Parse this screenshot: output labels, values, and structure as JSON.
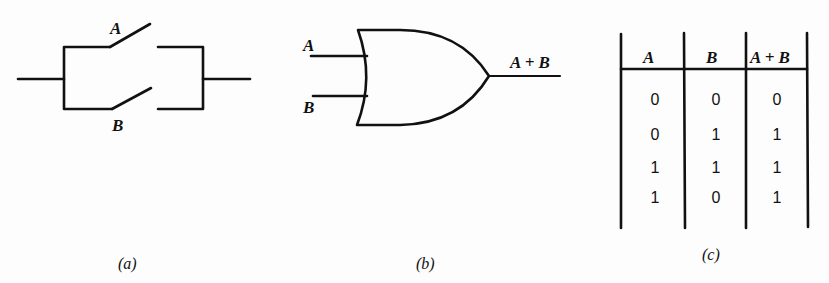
{
  "figure": {
    "panels": [
      {
        "id": "a",
        "caption": "(a)",
        "type": "parallel-switch-circuit",
        "switches": [
          "A",
          "B"
        ]
      },
      {
        "id": "b",
        "caption": "(b)",
        "type": "or-gate",
        "inputs": [
          "A",
          "B"
        ],
        "output": "A + B"
      },
      {
        "id": "c",
        "caption": "(c)",
        "type": "truth-table",
        "headers": [
          "A",
          "B",
          "A + B"
        ],
        "rows": [
          [
            "0",
            "0",
            "0"
          ],
          [
            "0",
            "1",
            "1"
          ],
          [
            "1",
            "1",
            "1"
          ],
          [
            "1",
            "0",
            "1"
          ]
        ]
      }
    ]
  }
}
